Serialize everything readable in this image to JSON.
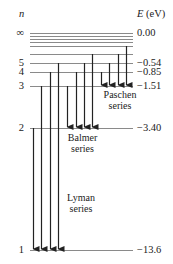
{
  "axes": {
    "n_header": "n",
    "e_header": "E (eV)"
  },
  "levels": [
    {
      "n": "∞",
      "energy": "0.00",
      "y": 33
    },
    {
      "n": "",
      "energy": "",
      "y": 36
    },
    {
      "n": "",
      "energy": "",
      "y": 39
    },
    {
      "n": "",
      "energy": "",
      "y": 42
    },
    {
      "n": "",
      "energy": "",
      "y": 46
    },
    {
      "n": "",
      "energy": "",
      "y": 54
    },
    {
      "n": "5",
      "energy": "−0.54",
      "y": 63
    },
    {
      "n": "4",
      "energy": "−0.85",
      "y": 72
    },
    {
      "n": "3",
      "energy": "−1.51",
      "y": 86
    },
    {
      "n": "2",
      "energy": "−3.40",
      "y": 128
    },
    {
      "n": "1",
      "energy": "−13.6",
      "y": 250
    }
  ],
  "series": [
    {
      "name_line1": "Lyman",
      "name_line2": "series",
      "target_y": 250,
      "arrows": [
        {
          "x": 33,
          "from_y": 128
        },
        {
          "x": 41,
          "from_y": 86
        },
        {
          "x": 50,
          "from_y": 72
        },
        {
          "x": 58,
          "from_y": 63
        }
      ]
    },
    {
      "name_line1": "Balmer",
      "name_line2": "series",
      "target_y": 128,
      "arrows": [
        {
          "x": 67,
          "from_y": 86
        },
        {
          "x": 76,
          "from_y": 72
        },
        {
          "x": 84,
          "from_y": 63
        },
        {
          "x": 92,
          "from_y": 54
        }
      ]
    },
    {
      "name_line1": "Paschen",
      "name_line2": "series",
      "target_y": 86,
      "arrows": [
        {
          "x": 101,
          "from_y": 72
        },
        {
          "x": 109,
          "from_y": 63
        },
        {
          "x": 118,
          "from_y": 54
        },
        {
          "x": 126,
          "from_y": 46
        }
      ]
    }
  ],
  "colors": {
    "line": "#8a8a8a",
    "arrow": "#222222",
    "text": "#222222"
  }
}
